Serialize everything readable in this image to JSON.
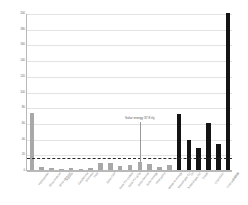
{
  "chart_data": {
    "type": "bar",
    "title": "",
    "xlabel": "",
    "ylabel": "",
    "ylim": [
      0,
      200
    ],
    "yticks": [
      0,
      20,
      40,
      60,
      80,
      100,
      120,
      140,
      160,
      180,
      200
    ],
    "ytick_labels": [
      "0",
      "20",
      "40",
      "60",
      "80",
      "100",
      "120",
      "140",
      "160",
      "180",
      "200"
    ],
    "grid": true,
    "legend": "none",
    "categories": [
      "Hydropower",
      "Wind onshore",
      "Wind offshore",
      "Nuclear",
      "Geothermal",
      "Biomass",
      "Tidal",
      "Solar CSP",
      "Solar PV rooftop",
      "Solar PV utility",
      "Solar thermal",
      "Solar energy",
      "Heat pump",
      "Waste to energy",
      "Natural gas CC",
      "Natural gas OC",
      "Oil",
      "Diesel",
      "Coal IGCC",
      "Coal subcritical",
      "Lignite"
    ],
    "values": [
      72,
      4,
      2,
      1,
      2,
      1,
      3,
      9,
      9,
      5,
      7,
      10,
      8,
      4,
      7,
      71,
      38,
      28,
      60,
      33,
      200
    ],
    "colors": [
      "#a8a8a8",
      "#a8a8a8",
      "#a8a8a8",
      "#a8a8a8",
      "#a8a8a8",
      "#a8a8a8",
      "#a8a8a8",
      "#a8a8a8",
      "#a8a8a8",
      "#a8a8a8",
      "#a8a8a8",
      "#a8a8a8",
      "#a8a8a8",
      "#a8a8a8",
      "#a8a8a8",
      "#141414",
      "#141414",
      "#141414",
      "#141414",
      "#141414",
      "#141414"
    ],
    "reference_line": {
      "label": "",
      "value": 17,
      "style": "dashed",
      "color": "#2a2a2a"
    },
    "annotations": [
      {
        "text": "Solar energy 37.8 t/y",
        "points_to_category": "Solar energy",
        "points_to_value": 10,
        "x_index": 11
      }
    ],
    "series_colors": {
      "renewable": "#a8a8a8",
      "fossil": "#141414"
    }
  }
}
